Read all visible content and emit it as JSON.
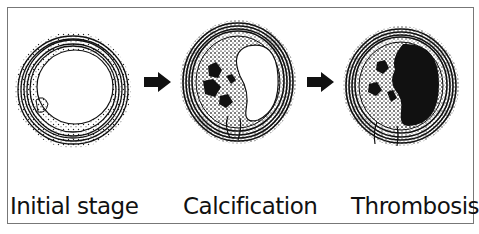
{
  "figure": {
    "stages": [
      {
        "id": "initial",
        "label": "Initial stage"
      },
      {
        "id": "calcification",
        "label": "Calcification"
      },
      {
        "id": "thrombosis",
        "label": "Thrombosis"
      }
    ],
    "arrows": [
      {
        "from": "initial",
        "to": "calcification"
      },
      {
        "from": "calcification",
        "to": "thrombosis"
      }
    ],
    "colors": {
      "ink": "#111111",
      "background": "#ffffff",
      "frame": "#777777"
    }
  }
}
